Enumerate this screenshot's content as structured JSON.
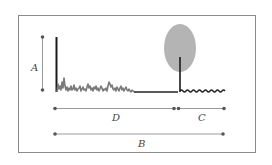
{
  "diagram": {
    "labels": {
      "A": "A",
      "B": "B",
      "C": "C",
      "D": "D"
    },
    "colors": {
      "frame": "#8a8a8a",
      "measure_line": "#9a9a9a",
      "measure_dot": "#555555",
      "spike": "#1a1a1a",
      "noise_signal": "#7a7a7a",
      "ellipse_fill": "#b4b4b4",
      "flat_line": "#222222"
    },
    "elements": [
      "frame-box",
      "measure-A-vertical",
      "main-spike",
      "noisy-signal",
      "flat-baseline",
      "gray-ellipse",
      "stem-under-ellipse",
      "wavy-signal",
      "measure-D",
      "measure-C",
      "measure-B"
    ]
  }
}
